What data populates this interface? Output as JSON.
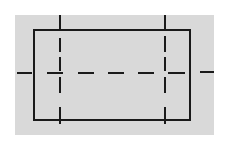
{
  "colors": {
    "page_background": "#ffffff",
    "panel_background": "#d9d9d9",
    "line": "#1a1a1a"
  },
  "panel": {
    "x": 15,
    "y": 15,
    "width": 199,
    "height": 120
  },
  "rectangle": {
    "x": 34,
    "y": 30,
    "width": 156,
    "height": 90,
    "stroke_width": 2
  },
  "center_line": {
    "y": 73,
    "outer_left_dash": [
      17,
      32
    ],
    "outer_right_dash": [
      200,
      214
    ],
    "inner_dashes": [
      [
        47,
        63
      ],
      [
        78,
        94
      ],
      [
        108,
        124
      ],
      [
        138,
        154
      ],
      [
        168,
        185
      ]
    ]
  },
  "vertical_lines": [
    {
      "name": "left",
      "x": 60,
      "top_tick": [
        15,
        30
      ],
      "dashes": [
        [
          38,
          52
        ],
        [
          57,
          71
        ],
        [
          77,
          93
        ],
        [
          107,
          124
        ]
      ]
    },
    {
      "name": "right",
      "x": 165,
      "top_tick": [
        15,
        30
      ],
      "dashes": [
        [
          36,
          52
        ],
        [
          57,
          71
        ],
        [
          77,
          93
        ],
        [
          107,
          124
        ]
      ]
    }
  ]
}
